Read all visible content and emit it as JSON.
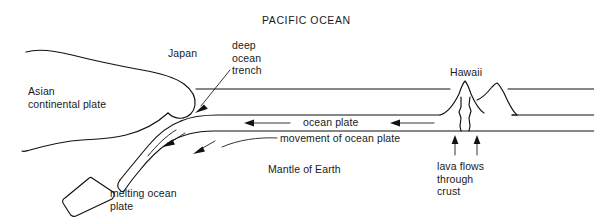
{
  "figure": {
    "kind": "cross-section-diagram",
    "background_color": "#ffffff",
    "line_color": "#111111"
  },
  "labels": {
    "ocean_title": "PACIFIC OCEAN",
    "japan": "Japan",
    "deep_ocean_trench": "deep\nocean\ntrench",
    "asian_continental_plate": "Asian\ncontinental plate",
    "hawaii": "Hawaii",
    "ocean_plate": "ocean plate",
    "movement_of_ocean_plate": "movement of ocean plate",
    "mantle_of_earth": "Mantle of Earth",
    "lava_flows_through_crust": "lava flows\nthrough\ncrust",
    "melting_ocean_plate": "melting ocean\nplate"
  },
  "features": {
    "sea_surface_label": "sea surface line",
    "sea_floor_label": "ocean floor line",
    "plate_base_label": "base of ocean plate line",
    "subducting_slab_label": "subducting ocean plate slab",
    "detached_slab_label": "detached melting slab",
    "volcano_left_label": "Hawaii volcano left peak",
    "volcano_right_label": "Hawaii volcano right peak",
    "conduit_left_label": "left lava conduit",
    "conduit_right_label": "right lava conduit"
  },
  "arrows": {
    "ocean_plate_left": "leftward arrow west of ocean plate label",
    "ocean_plate_right": "leftward arrow east of ocean plate label",
    "slab_descent_upper": "down-left arrow on upper slab",
    "slab_descent_lower": "down-left arrow on lower slab",
    "trench_pointer": "pointer from deep ocean trench label to trench",
    "movement_pointer": "pointer from movement of ocean plate label to slab",
    "lava_left": "upward lava arrow left",
    "lava_right": "upward lava arrow right"
  }
}
